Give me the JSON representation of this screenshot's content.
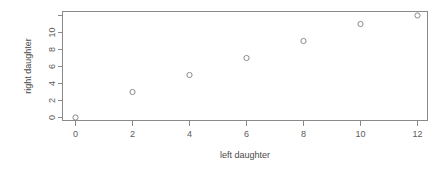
{
  "chart_data": {
    "type": "scatter",
    "title": "",
    "xlabel": "left daughter",
    "ylabel": "right daughter",
    "x": [
      0,
      2,
      4,
      6,
      8,
      10,
      12
    ],
    "y": [
      0,
      3,
      5,
      7,
      9,
      11,
      12
    ],
    "points": [
      {
        "x": 0,
        "y": 0
      },
      {
        "x": 2,
        "y": 3
      },
      {
        "x": 4,
        "y": 5
      },
      {
        "x": 6,
        "y": 7
      },
      {
        "x": 8,
        "y": 9
      },
      {
        "x": 10,
        "y": 11
      },
      {
        "x": 12,
        "y": 12
      }
    ],
    "xlim": [
      -0.55,
      12.9
    ],
    "ylim": [
      -0.35,
      12.6
    ],
    "xticks": [
      0,
      2,
      4,
      6,
      8,
      10,
      12
    ],
    "xticklabels": [
      "0",
      "2",
      "4",
      "6",
      "8",
      "10",
      "12"
    ],
    "yticks": [
      0,
      2,
      4,
      6,
      8,
      10,
      12
    ],
    "yticklabels": [
      "0",
      "2",
      "4",
      "6",
      "8",
      "10",
      ""
    ],
    "grid": false,
    "legend": false,
    "marker": "open-circle",
    "marker_color": "#8a8a8a",
    "axis_color": "#8a8a8a",
    "text_color": "#5b5b5b",
    "background": "#ffffff"
  },
  "axes": {
    "x_title": "left daughter",
    "y_title": "right daughter"
  },
  "ticks": {
    "x": [
      "0",
      "2",
      "4",
      "6",
      "8",
      "10",
      "12"
    ],
    "y": [
      "0",
      "2",
      "4",
      "6",
      "8",
      "10"
    ]
  }
}
